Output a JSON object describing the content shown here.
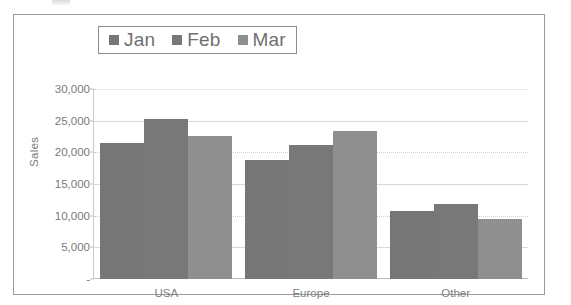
{
  "chart_data": {
    "type": "bar",
    "title": "",
    "xlabel": "",
    "ylabel": "Sales",
    "categories": [
      "USA",
      "Europe",
      "Other"
    ],
    "series": [
      {
        "name": "Jan",
        "values": [
          21400,
          18800,
          10700
        ],
        "color": "#767676"
      },
      {
        "name": "Feb",
        "values": [
          25200,
          21200,
          11900
        ],
        "color": "#787878"
      },
      {
        "name": "Mar",
        "values": [
          22600,
          23400,
          9400
        ],
        "color": "#8f8f8f"
      }
    ],
    "ylim": [
      0,
      30000
    ],
    "ytick_values": [
      0,
      5000,
      10000,
      15000,
      20000,
      25000,
      30000
    ],
    "ytick_labels": [
      "-",
      "5,000",
      "10,000",
      "15,000",
      "20,000",
      "25,000",
      "30,000"
    ],
    "grid": true,
    "legend_position": "top",
    "legend_entries": [
      "Jan",
      "Feb",
      "Mar"
    ]
  },
  "legend": {
    "items": [
      {
        "label": "Jan"
      },
      {
        "label": "Feb"
      },
      {
        "label": "Mar"
      }
    ]
  },
  "axes": {
    "y_title": "Sales"
  },
  "colors": {
    "series_jan": "#767676",
    "series_feb": "#787878",
    "series_mar": "#8f8f8f",
    "gridline": "#d8d8d8",
    "frame_border": "#9a9a9a",
    "tick_text": "#7a7a7a"
  }
}
